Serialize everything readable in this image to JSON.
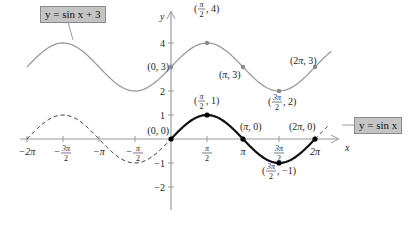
{
  "chart_data": {
    "type": "line",
    "title": "",
    "xlabel": "x",
    "ylabel": "y",
    "xlim": [
      -6.2832,
      7.2
    ],
    "ylim": [
      -2.8,
      5.3
    ],
    "grid": false,
    "x_ticks": [
      {
        "value": -6.2832,
        "label": "-2π"
      },
      {
        "value": -4.7124,
        "label": "-3π/2"
      },
      {
        "value": -3.1416,
        "label": "-π"
      },
      {
        "value": -1.5708,
        "label": "-π/2"
      },
      {
        "value": 1.5708,
        "label": "π/2"
      },
      {
        "value": 3.1416,
        "label": "π"
      },
      {
        "value": 4.7124,
        "label": "3π/2"
      },
      {
        "value": 6.2832,
        "label": "2π"
      }
    ],
    "y_ticks": [
      -2,
      -1,
      1,
      2,
      4
    ],
    "series": [
      {
        "name": "y = sin x + 3",
        "style": "solid",
        "color": "#9a9a9a",
        "x_range": [
          -6.2832,
          7.0
        ],
        "points": [
          {
            "x": 0,
            "y": 3,
            "label": "(0, 3)"
          },
          {
            "x": 1.5708,
            "y": 4,
            "label": "(π/2, 4)"
          },
          {
            "x": 3.1416,
            "y": 3,
            "label": "(π, 3)"
          },
          {
            "x": 4.7124,
            "y": 2,
            "label": "(3π/2, 2)"
          },
          {
            "x": 6.2832,
            "y": 3,
            "label": "(2π, 3)"
          }
        ]
      },
      {
        "name": "y = sin x",
        "style": "solid on [0, 2π], dashed elsewhere",
        "color": "#111111",
        "x_range": [
          -6.2832,
          6.9
        ],
        "points": [
          {
            "x": 0,
            "y": 0,
            "label": "(0, 0)"
          },
          {
            "x": 1.5708,
            "y": 1,
            "label": "(π/2, 1)"
          },
          {
            "x": 3.1416,
            "y": 0,
            "label": "(π, 0)"
          },
          {
            "x": 4.7124,
            "y": -1,
            "label": "(3π/2, -1)"
          },
          {
            "x": 6.2832,
            "y": 0,
            "label": "(2π, 0)"
          }
        ]
      }
    ],
    "annotations": [
      {
        "text": "y = sin x + 3",
        "type": "callout-box"
      },
      {
        "text": "y = sin x",
        "type": "callout-box"
      }
    ]
  },
  "labels": {
    "upper_curve": "y = sin x + 3",
    "lower_curve": "y = sin x",
    "x_axis": "x",
    "y_axis": "y"
  }
}
